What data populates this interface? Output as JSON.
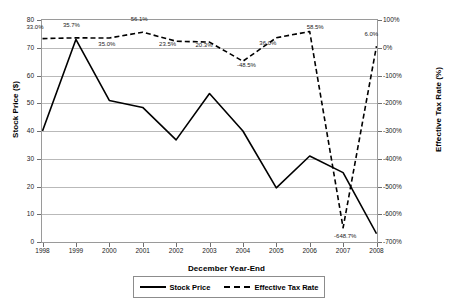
{
  "chart_data": {
    "type": "line",
    "title": "",
    "xlabel": "December Year-End",
    "ylabel": "Stock Price ($)",
    "y2label": "Effective Tax Rate (%)",
    "categories": [
      "1998",
      "1999",
      "2000",
      "2001",
      "2002",
      "2003",
      "2004",
      "2005",
      "2006",
      "2007",
      "2008"
    ],
    "ylim": [
      0,
      80
    ],
    "yticks": [
      "0",
      "10",
      "20",
      "30",
      "40",
      "50",
      "60",
      "70",
      "80"
    ],
    "y2lim": [
      -700,
      100
    ],
    "y2ticks": [
      "100%",
      "0%",
      "-100%",
      "-200%",
      "-300%",
      "-400%",
      "-500%",
      "-600%",
      "-700%"
    ],
    "grid": true,
    "legend_position": "bottom",
    "series": [
      {
        "name": "Stock Price",
        "axis": "left",
        "style": "solid",
        "values": [
          40.0,
          73.0,
          51.0,
          48.5,
          36.8,
          53.5,
          40.0,
          19.5,
          31.0,
          25.0,
          3.0
        ]
      },
      {
        "name": "Effective Tax Rate",
        "axis": "right",
        "style": "dashed",
        "values": [
          33.0,
          35.7,
          35.0,
          56.1,
          23.5,
          20.3,
          -48.5,
          36.0,
          58.5,
          -648.7,
          6.0
        ],
        "labels": [
          "33.0%",
          "35.7%",
          "35.0%",
          "56.1%",
          "23.5%",
          "20.3%",
          "-48.5%",
          "36.0%",
          "58.5%",
          "-648.7%",
          "6.0%"
        ]
      }
    ]
  },
  "legend": {
    "items": [
      {
        "label": "Stock Price"
      },
      {
        "label": "Effective Tax Rate"
      }
    ]
  }
}
